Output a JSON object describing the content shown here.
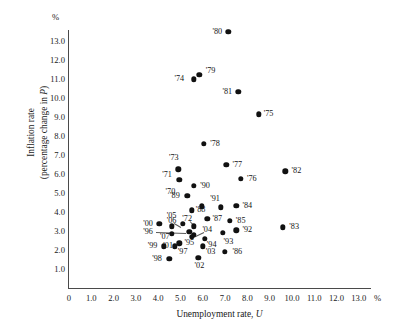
{
  "chart_data": {
    "type": "scatter",
    "title": "",
    "xlabel": "Unemployment rate, U",
    "ylabel": "Inflation rate (percentage change in P)",
    "ylabel_line1": "Inflation rate",
    "ylabel_line2": "(percentage change in P)",
    "x_unit": "%",
    "y_unit": "%",
    "xlim": [
      0,
      13.5
    ],
    "ylim": [
      0,
      13.5
    ],
    "grid": false,
    "legend": "none",
    "xticks": [
      "0",
      "1.0",
      "2.0",
      "3.0",
      "4.0",
      "5.0",
      "6.0",
      "7.0",
      "8.0",
      "9.0",
      "10.0",
      "11.0",
      "12.0",
      "13.0"
    ],
    "xtick_values": [
      0,
      1,
      2,
      3,
      4,
      5,
      6,
      7,
      8,
      9,
      10,
      11,
      12,
      13
    ],
    "yticks": [
      "1.0",
      "2.0",
      "3.0",
      "4.0",
      "5.0",
      "6.0",
      "7.0",
      "8.0",
      "9.0",
      "10.0",
      "11.0",
      "12.0",
      "13.0"
    ],
    "ytick_values": [
      1,
      2,
      3,
      4,
      5,
      6,
      7,
      8,
      9,
      10,
      11,
      12,
      13
    ],
    "points": [
      {
        "label": "'70",
        "x": 4.95,
        "y": 5.7,
        "lx": 4.55,
        "ly": 5.05
      },
      {
        "label": "'71",
        "x": 5.95,
        "y": 4.3,
        "lx": 4.4,
        "ly": 5.95
      },
      {
        "label": "'72",
        "x": 5.6,
        "y": 3.25,
        "lx": 5.3,
        "ly": 3.65
      },
      {
        "label": "'73",
        "x": 4.9,
        "y": 6.25,
        "lx": 4.7,
        "ly": 6.85
      },
      {
        "label": "'74",
        "x": 5.6,
        "y": 11.0,
        "lx": 4.95,
        "ly": 11.0
      },
      {
        "label": "'75",
        "x": 8.5,
        "y": 9.15,
        "lx": 8.95,
        "ly": 9.15
      },
      {
        "label": "'76",
        "x": 7.7,
        "y": 5.75,
        "lx": 8.2,
        "ly": 5.75
      },
      {
        "label": "'77",
        "x": 7.05,
        "y": 6.5,
        "lx": 7.55,
        "ly": 6.5
      },
      {
        "label": "'78",
        "x": 6.05,
        "y": 7.6,
        "lx": 6.55,
        "ly": 7.6
      },
      {
        "label": "'79",
        "x": 5.85,
        "y": 11.25,
        "lx": 6.35,
        "ly": 11.45
      },
      {
        "label": "'80",
        "x": 7.15,
        "y": 13.5,
        "lx": 6.65,
        "ly": 13.5
      },
      {
        "label": "'81",
        "x": 7.6,
        "y": 10.35,
        "lx": 7.1,
        "ly": 10.35
      },
      {
        "label": "'82",
        "x": 9.7,
        "y": 6.15,
        "lx": 10.2,
        "ly": 6.15
      },
      {
        "label": "'83",
        "x": 9.6,
        "y": 3.2,
        "lx": 10.1,
        "ly": 3.2
      },
      {
        "label": "'84",
        "x": 7.5,
        "y": 4.35,
        "lx": 8.0,
        "ly": 4.35
      },
      {
        "label": "'85",
        "x": 7.2,
        "y": 3.55,
        "lx": 7.7,
        "ly": 3.55
      },
      {
        "label": "'86",
        "x": 7.0,
        "y": 1.9,
        "lx": 7.55,
        "ly": 1.9
      },
      {
        "label": "'87",
        "x": 6.2,
        "y": 3.65,
        "lx": 6.65,
        "ly": 3.65
      },
      {
        "label": "'88",
        "x": 5.5,
        "y": 4.1,
        "lx": 5.9,
        "ly": 4.1
      },
      {
        "label": "'89",
        "x": 5.3,
        "y": 4.85,
        "lx": 4.75,
        "ly": 4.85
      },
      {
        "label": "'90",
        "x": 5.6,
        "y": 5.4,
        "lx": 6.1,
        "ly": 5.4
      },
      {
        "label": "'91",
        "x": 6.8,
        "y": 4.25,
        "lx": 6.55,
        "ly": 4.7
      },
      {
        "label": "'92",
        "x": 7.5,
        "y": 3.05,
        "lx": 8.0,
        "ly": 3.05
      },
      {
        "label": "'93",
        "x": 6.9,
        "y": 2.9,
        "lx": 7.15,
        "ly": 2.45
      },
      {
        "label": "'94",
        "x": 6.1,
        "y": 2.6,
        "lx": 6.4,
        "ly": 2.25
      },
      {
        "label": "'95",
        "x": 5.6,
        "y": 2.8,
        "lx": 5.4,
        "ly": 2.35
      },
      {
        "label": "'96",
        "x": 5.4,
        "y": 2.95,
        "lx": 3.55,
        "ly": 2.95
      },
      {
        "label": "'97",
        "x": 4.95,
        "y": 2.35,
        "lx": 5.1,
        "ly": 1.9
      },
      {
        "label": "'98",
        "x": 4.5,
        "y": 1.55,
        "lx": 3.95,
        "ly": 1.55
      },
      {
        "label": "'99",
        "x": 4.25,
        "y": 2.2,
        "lx": 3.75,
        "ly": 2.2
      },
      {
        "label": "'00",
        "x": 4.05,
        "y": 3.4,
        "lx": 3.55,
        "ly": 3.4
      },
      {
        "label": "'01",
        "x": 4.75,
        "y": 2.2,
        "lx": 4.45,
        "ly": 2.2
      },
      {
        "label": "'02",
        "x": 5.8,
        "y": 1.6,
        "lx": 5.85,
        "ly": 1.15
      },
      {
        "label": "'03",
        "x": 6.0,
        "y": 2.2,
        "lx": 6.35,
        "ly": 1.9
      },
      {
        "label": "'04",
        "x": 5.5,
        "y": 2.7,
        "lx": 6.2,
        "ly": 3.05
      },
      {
        "label": "'05",
        "x": 5.1,
        "y": 3.4,
        "lx": 4.6,
        "ly": 3.8
      },
      {
        "label": "'06",
        "x": 4.6,
        "y": 3.25,
        "lx": 4.6,
        "ly": 3.55
      },
      {
        "label": "'07",
        "x": 4.6,
        "y": 2.85,
        "lx": 4.3,
        "ly": 2.7
      }
    ],
    "leaders": [
      {
        "from_x": 3.9,
        "from_y": 2.95,
        "to_x": 5.25,
        "to_y": 2.9
      },
      {
        "from_x": 4.72,
        "from_y": 3.42,
        "to_x": 5.05,
        "to_y": 3.2
      },
      {
        "from_x": 5.42,
        "from_y": 3.52,
        "to_x": 5.6,
        "to_y": 3.3
      },
      {
        "from_x": 6.05,
        "from_y": 2.97,
        "to_x": 5.6,
        "to_y": 2.72
      }
    ]
  }
}
